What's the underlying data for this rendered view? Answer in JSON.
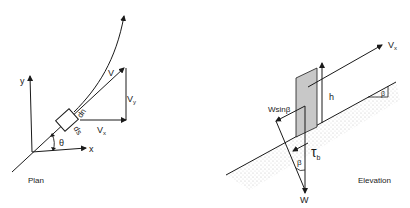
{
  "plan": {
    "caption": "Plan",
    "axis_y": "y",
    "axis_x": "x",
    "angle": "θ",
    "velocity": "V",
    "vx": "V",
    "vx_sub": "x",
    "vy": "V",
    "vy_sub": "y",
    "dn": "dn",
    "ds": "ds"
  },
  "elevation": {
    "caption": "Elevation",
    "vx": "V",
    "vx_sub": "x",
    "h": "h",
    "wsin": "Wsinβ",
    "beta": "β",
    "beta_slope": "β",
    "tau": "τ",
    "tau_sub": "b",
    "w": "W"
  },
  "colors": {
    "line": "#1a1a1a",
    "shade": "#c8c8c8",
    "ground": "#d6d6d6"
  }
}
